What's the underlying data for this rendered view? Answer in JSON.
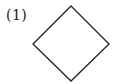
{
  "figure": {
    "label": "(1)",
    "shape": "square rotated 45° (diamond)",
    "stroke_color": "#222222",
    "fill_color": "#ffffff",
    "vertices": {
      "top": [
        71,
        6
      ],
      "right": [
        109,
        44
      ],
      "bottom": [
        71,
        81
      ],
      "left": [
        33,
        44
      ]
    }
  }
}
